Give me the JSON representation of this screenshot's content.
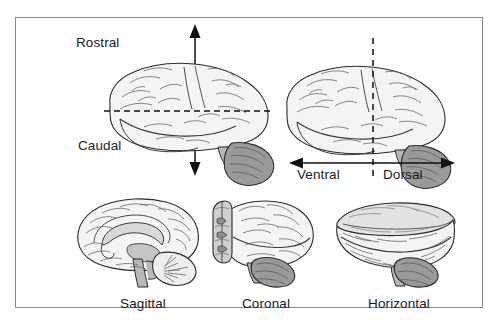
{
  "figure": {
    "background_color": "#ffffff",
    "frame_border_color": "#8a8a8a",
    "ink_color": "#1b1b1b"
  },
  "top_left_panel": {
    "name": "rostral-caudal-axis-panel",
    "brain_view": "lateral-view-brain-left-facing",
    "axis_type": "vertical-double-arrow",
    "plane_line": "horizontal-dashed-line",
    "labels": {
      "up": "Rostral",
      "down": "Caudal"
    }
  },
  "top_right_panel": {
    "name": "ventral-dorsal-axis-panel",
    "brain_view": "lateral-view-brain-left-facing",
    "axis_type": "horizontal-double-arrow",
    "plane_line": "vertical-dashed-line",
    "labels": {
      "left": "Ventral",
      "right": "Dorsal"
    }
  },
  "bottom_panels": [
    {
      "name": "sagittal-section",
      "label": "Sagittal",
      "brain_view": "midsagittal-section-with-corpus-callosum-brainstem-cerebellum"
    },
    {
      "name": "coronal-section",
      "label": "Coronal",
      "brain_view": "coronal-cut-face-with-ventricles"
    },
    {
      "name": "horizontal-section",
      "label": "Horizontal",
      "brain_view": "horizontal-cut-flat-top-surface"
    }
  ],
  "colors": {
    "outline": "#2b2b2b",
    "cortex_fill": "#f4f4f2",
    "gyri_line": "#5d5d5d",
    "cerebellum_fill": "#9a9a9a",
    "brainstem_fill": "#b8b8b8",
    "cut_face_fill": "#cfcfcf",
    "dashed_line": "#111111",
    "arrow": "#111111"
  }
}
